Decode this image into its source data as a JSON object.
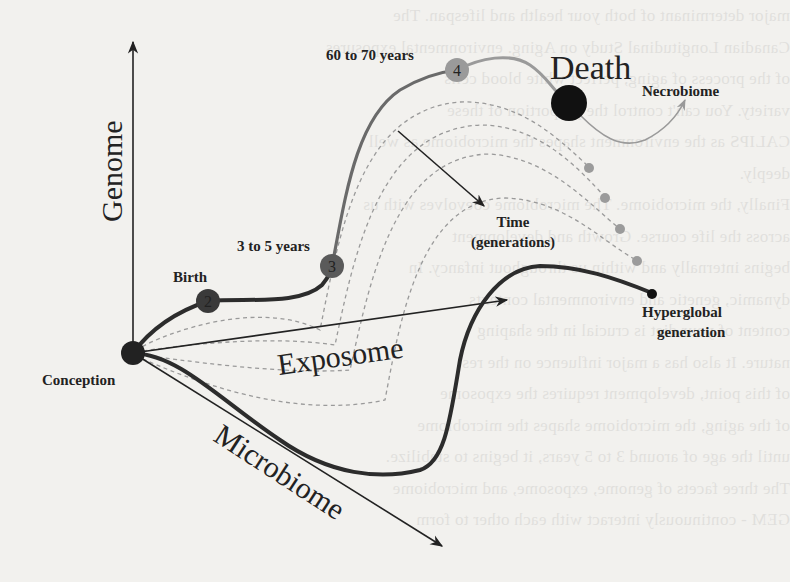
{
  "diagram": {
    "axes": {
      "genome_label": "Genome",
      "exposome_label": "Exposome",
      "microbiome_label": "Microbiome"
    },
    "nodes": [
      {
        "number": "1",
        "label": "Conception",
        "color": "#222222"
      },
      {
        "number": "2",
        "label": "Birth",
        "color": "#3a3a3a"
      },
      {
        "number": "3",
        "label": "3 to 5 years",
        "color": "#5a5a5a"
      },
      {
        "number": "4",
        "label": "60 to 70 years",
        "color": "#9a9a9a"
      }
    ],
    "death": {
      "label": "Death",
      "color": "#111111"
    },
    "necrobiome_label": "Necrobiome",
    "time_label_line1": "Time",
    "time_label_line2": "(generations)",
    "hyperglobal_line1": "Hyperglobal",
    "hyperglobal_line2": "generation",
    "colors": {
      "background": "#f2f1ee",
      "axis": "#222222",
      "trajectory_dark": "#2c2c2c",
      "trajectory_light": "#8a8a8a",
      "dashed": "#9a9a9a",
      "generation_dots": "#9b9b9b"
    }
  },
  "background_text": [
    "major determinant of both your health and lifespan. The",
    "Canadian Longitudinal Study on Aging. environmental exposures",
    "of the process of aging, perfect white blood cells",
    "variety. You can't control the proportion of these",
    "CALIPS as the environment shapes the microbiome as well",
    "deeply.",
    "Finally, the microbiome. The microbiome coevolves with us",
    "across the life course. Growth and development",
    "begins internally and within us throughout infancy. In",
    "dynamic, genetic and environmental contexts",
    "content of your diet is crucial in the shaping",
    "nature. It also has a major influence on the rest",
    "of this point, development requires the exposome",
    "of the aging, the microbiome shapes the microbiome",
    "until the age of around 3 to 5 years, it begins to stabilize.",
    "The three facets of genome, exposome, and microbiome",
    "GEM - continuously interact with each other to form"
  ]
}
